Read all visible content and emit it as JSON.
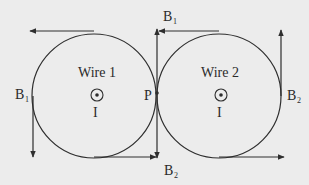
{
  "diagram": {
    "wire1": {
      "label": "Wire 1",
      "current_label": "I",
      "symbol": "current-out-of-page-icon",
      "center": [
        94,
        96
      ],
      "radius": 62
    },
    "wire2": {
      "label": "Wire 2",
      "current_label": "I",
      "symbol": "current-out-of-page-icon",
      "center": [
        219,
        96
      ],
      "radius": 62
    },
    "point": {
      "label": "P"
    },
    "field_labels": {
      "b1_left": "B",
      "b1_left_sub": "1",
      "b1_top": "B",
      "b1_top_sub": "1",
      "b2_right": "B",
      "b2_right_sub": "2",
      "b2_bottom": "B",
      "b2_bottom_sub": "2"
    },
    "colors": {
      "line": "#2e2e2e",
      "background": "#ececec"
    }
  }
}
